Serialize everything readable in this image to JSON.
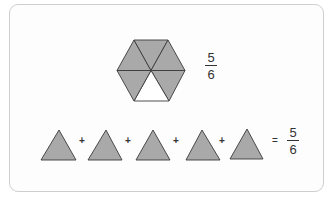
{
  "colors": {
    "shade_fill": "#a9a9a9",
    "empty_fill": "#ffffff",
    "stroke": "#3a3a3a",
    "card_border": "#cfcfcf"
  },
  "hexagon": {
    "center": [
      151,
      70.5
    ],
    "vertices": [
      [
        117,
        70.5
      ],
      [
        134,
        40
      ],
      [
        168,
        40
      ],
      [
        185,
        70.5
      ],
      [
        169,
        101
      ],
      [
        134,
        101
      ]
    ],
    "sectors_total": 6,
    "sectors_shaded": 5,
    "unshaded_sector": "bottom"
  },
  "hexagon_fraction": {
    "numerator": "5",
    "denominator": "6"
  },
  "equation": {
    "triangles": [
      {
        "apex": [
          59,
          130
        ],
        "base_left": [
          41,
          160
        ],
        "base_right": [
          76,
          160
        ]
      },
      {
        "apex": [
          106,
          130
        ],
        "base_left": [
          88,
          160
        ],
        "base_right": [
          122,
          160
        ]
      },
      {
        "apex": [
          153,
          130
        ],
        "base_left": [
          136,
          160
        ],
        "base_right": [
          170,
          160
        ]
      },
      {
        "apex": [
          202,
          130
        ],
        "base_left": [
          186,
          160
        ],
        "base_right": [
          220,
          160
        ]
      },
      {
        "apex": [
          247,
          129
        ],
        "base_left": [
          230,
          159
        ],
        "base_right": [
          263,
          159
        ]
      }
    ],
    "operators": [
      "+",
      "+",
      "+",
      "+"
    ],
    "equals": "=",
    "result_fraction": {
      "numerator": "5",
      "denominator": "6"
    }
  }
}
